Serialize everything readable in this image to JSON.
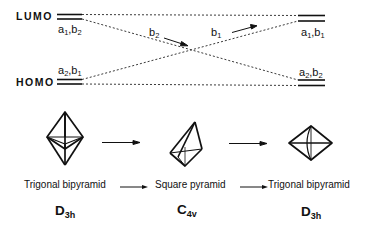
{
  "levels": {
    "lumo_label": "LUMO",
    "homo_label": "HOMO"
  },
  "orbital_symmetries": {
    "left_lumo": {
      "a": "a",
      "a_sub": "1",
      "b": "b",
      "b_sub": "2"
    },
    "left_homo": {
      "a": "a",
      "a_sub": "2",
      "b": "b",
      "b_sub": "1"
    },
    "right_lumo": {
      "a": "a",
      "a_sub": "1",
      "b": "b",
      "b_sub": "1"
    },
    "right_homo": {
      "a": "a",
      "a_sub": "2",
      "b": "b",
      "b_sub": "2"
    }
  },
  "crossing_arrows": {
    "left": {
      "sym": "b",
      "sub": "2"
    },
    "right": {
      "sym": "b",
      "sub": "1"
    }
  },
  "shapes": [
    {
      "name": "Trigonal bipyramid",
      "group": "D",
      "group_sub": "3h",
      "icon": "trigonal-bipyramid-icon"
    },
    {
      "name": "Square pyramid",
      "group": "C",
      "group_sub": "4v",
      "icon": "square-pyramid-icon"
    },
    {
      "name": "Trigonal bipyramid",
      "group": "D",
      "group_sub": "3h",
      "icon": "trigonal-bipyramid-rotated-icon"
    }
  ],
  "colors": {
    "ink": "#111111",
    "background": "#ffffff"
  }
}
